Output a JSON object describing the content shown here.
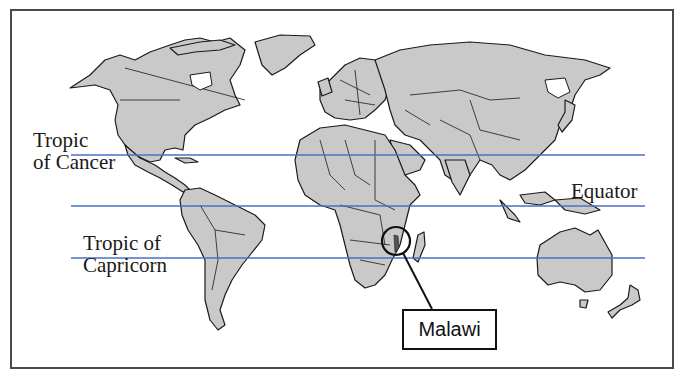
{
  "map": {
    "type": "world-map",
    "land_color": "#c9c9c9",
    "line_color": "#4a6fc4",
    "latitude_lines": [
      {
        "name": "Tropic of Cancer",
        "y": 155
      },
      {
        "name": "Equator",
        "y": 206
      },
      {
        "name": "Tropic of Capricorn",
        "y": 258
      }
    ]
  },
  "labels": {
    "tropic_cancer_line1": "Tropic",
    "tropic_cancer_line2": "of Cancer",
    "equator": "Equator",
    "tropic_capricorn_line1": "Tropic of",
    "tropic_capricorn_line2": "Capricorn"
  },
  "callout": {
    "label": "Malawi",
    "highlight": "circle"
  }
}
